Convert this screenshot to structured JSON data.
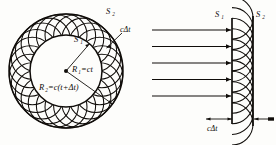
{
  "figure": {
    "background_color": "#fdfdfb",
    "ink_color": "#100d0a",
    "panels": [
      {
        "id": "spherical-wave",
        "name": "spherical-wavefront-construction",
        "description": "Circular (spherical) wavefront expanding from a point source, with Huygens secondary wavelets",
        "labels": {
          "inner_surface": "S",
          "inner_surface_sub": "1",
          "outer_surface": "S",
          "outer_surface_sub": "2",
          "radius_inner": "R",
          "radius_inner_sub": "1",
          "radius_inner_value": "=ct",
          "radius_outer": "R",
          "radius_outer_sub": "2",
          "radius_outer_value": "=c(t+Δt)",
          "wavelet_radius": "cΔt"
        },
        "geometry": {
          "center_x": 66,
          "center_y": 71,
          "inner_radius": 36,
          "outer_radius": 57,
          "wavelet_radius": 21,
          "wavelet_count": 26
        }
      },
      {
        "id": "plane-wave",
        "name": "plane-wavefront-construction",
        "description": "Plane wavefront advancing to the right, with Huygens secondary wavelets between S1 and S2",
        "labels": {
          "inner_surface": "S",
          "inner_surface_sub": "1",
          "outer_surface": "S",
          "outer_surface_sub": "2",
          "wavelet_radius": "cΔt"
        },
        "geometry": {
          "s1_x": 232,
          "s2_x": 253,
          "top_y": 18,
          "bottom_y": 124,
          "wavelet_radius": 21,
          "wavelet_count": 11,
          "ray_count": 5,
          "ray_start_x": 152,
          "ray_end_x": 231
        }
      }
    ]
  }
}
